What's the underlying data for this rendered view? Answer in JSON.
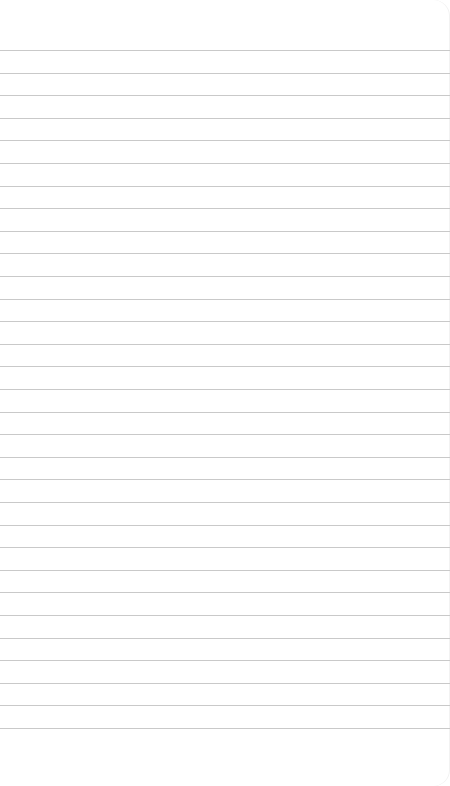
{
  "notepad": {
    "title": "",
    "line_color": "#c9c9c9",
    "background": "#ffffff",
    "first_line_y": 50,
    "line_spacing": 22.6,
    "line_count": 31,
    "lines": [
      "",
      "",
      "",
      "",
      "",
      "",
      "",
      "",
      "",
      "",
      "",
      "",
      "",
      "",
      "",
      "",
      "",
      "",
      "",
      "",
      "",
      "",
      "",
      "",
      "",
      "",
      "",
      "",
      "",
      "",
      ""
    ]
  }
}
